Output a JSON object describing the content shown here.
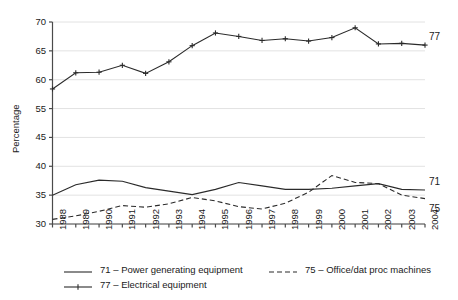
{
  "chart_data": {
    "type": "line",
    "title": "",
    "subtitle": "",
    "xlabel": "",
    "ylabel": "Percentage",
    "x": [
      1988,
      1989,
      1990,
      1991,
      1992,
      1993,
      1994,
      1995,
      1996,
      1997,
      1998,
      1999,
      2000,
      2001,
      2002,
      2003,
      2004
    ],
    "categories": [
      "1988",
      "1989",
      "1990",
      "1991",
      "1992",
      "1993",
      "1994",
      "1995",
      "1996",
      "1997",
      "1998",
      "1999",
      "2000",
      "2001",
      "2002",
      "2003",
      "2004"
    ],
    "xlim": [
      1988,
      2004
    ],
    "ylim": [
      30,
      70
    ],
    "yticks": [
      30,
      35,
      40,
      45,
      55,
      60,
      65,
      70
    ],
    "ytick_labels": [
      "30",
      "35",
      "40",
      "45",
      "55",
      "60",
      "65",
      "70"
    ],
    "grid": "horizontal",
    "legend_position": "below",
    "series": [
      {
        "name": "71 – Power generating equipment",
        "code": "71",
        "style": "solid",
        "marker": "none",
        "end_label": "71",
        "color": "#2b2b2b",
        "values": [
          35.0,
          36.8,
          37.6,
          37.4,
          36.3,
          35.7,
          35.1,
          36.0,
          37.2,
          36.6,
          36.0,
          36.0,
          36.2,
          36.6,
          37.0,
          36.0,
          35.9
        ]
      },
      {
        "name": "75 – Office/dat proc machines",
        "code": "75",
        "style": "dashed",
        "marker": "none",
        "end_label": "75",
        "color": "#2b2b2b",
        "values": [
          30.8,
          31.4,
          32.2,
          33.2,
          32.9,
          33.5,
          34.6,
          34.0,
          33.0,
          32.6,
          33.6,
          35.5,
          38.4,
          37.2,
          37.0,
          35.0,
          34.4
        ]
      },
      {
        "name": "77 – Electrical equipment",
        "code": "77",
        "style": "solid",
        "marker": "plus",
        "end_label": "77",
        "color": "#2b2b2b",
        "values": [
          58.4,
          61.2,
          61.3,
          62.5,
          61.1,
          63.1,
          65.9,
          68.1,
          67.5,
          66.8,
          67.1,
          66.7,
          67.3,
          69.0,
          66.2,
          66.3,
          66.0
        ]
      }
    ]
  },
  "legend": {
    "entries": [
      {
        "label": "71 – Power generating equipment",
        "key": "solid-line"
      },
      {
        "label": "75 – Office/dat proc machines",
        "key": "dashed-line"
      },
      {
        "label": "77 – Electrical equipment",
        "key": "solid-line-plus-marker"
      }
    ]
  },
  "colors": {
    "line": "#2b2b2b",
    "grid": "#e2e2e2",
    "axis": "#4a4a4a",
    "text": "#1a1a1a",
    "background": "#ffffff"
  }
}
